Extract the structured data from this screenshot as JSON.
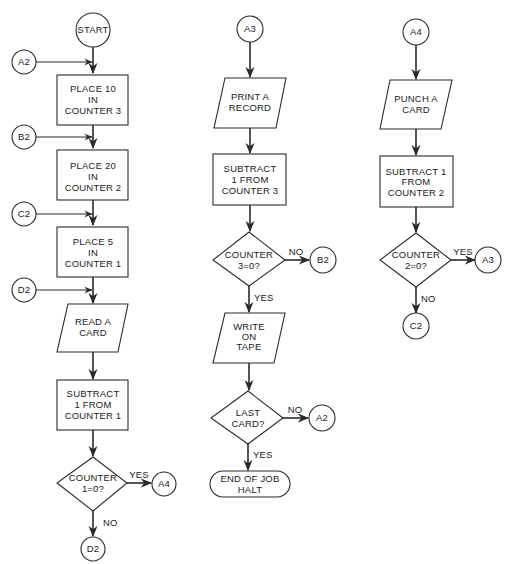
{
  "diagram": {
    "type": "flowchart",
    "colors": {
      "stroke": "#2a2a2a",
      "text": "#1a1a1a",
      "background": "#ffffff"
    },
    "columns": [
      {
        "id": "col1",
        "nodes": [
          {
            "id": "start",
            "shape": "circle",
            "lines": [
              "START"
            ]
          },
          {
            "id": "conn_a2_in",
            "shape": "connector",
            "lines": [
              "A2"
            ]
          },
          {
            "id": "place10",
            "shape": "process",
            "lines": [
              "PLACE 10",
              "IN",
              "COUNTER 3"
            ]
          },
          {
            "id": "conn_b2_in",
            "shape": "connector",
            "lines": [
              "B2"
            ]
          },
          {
            "id": "place20",
            "shape": "process",
            "lines": [
              "PLACE 20",
              "IN",
              "COUNTER 2"
            ]
          },
          {
            "id": "conn_c2_in",
            "shape": "connector",
            "lines": [
              "C2"
            ]
          },
          {
            "id": "place5",
            "shape": "process",
            "lines": [
              "PLACE 5",
              "IN",
              "COUNTER 1"
            ]
          },
          {
            "id": "conn_d2_in",
            "shape": "connector",
            "lines": [
              "D2"
            ]
          },
          {
            "id": "read_card",
            "shape": "io",
            "lines": [
              "READ A",
              "CARD"
            ]
          },
          {
            "id": "sub_c1",
            "shape": "process",
            "lines": [
              "SUBTRACT",
              "1 FROM",
              "COUNTER 1"
            ]
          },
          {
            "id": "dec_c1",
            "shape": "decision",
            "lines": [
              "COUNTER",
              "1=0?"
            ]
          },
          {
            "id": "conn_a4_out",
            "shape": "connector",
            "lines": [
              "A4"
            ]
          },
          {
            "id": "conn_d2_out",
            "shape": "connector",
            "lines": [
              "D2"
            ]
          }
        ],
        "edge_labels": {
          "yes": "YES",
          "no": "NO"
        }
      },
      {
        "id": "col2",
        "nodes": [
          {
            "id": "conn_a3_in",
            "shape": "connector",
            "lines": [
              "A3"
            ]
          },
          {
            "id": "print_record",
            "shape": "io",
            "lines": [
              "PRINT A",
              "RECORD"
            ]
          },
          {
            "id": "sub_c3",
            "shape": "process",
            "lines": [
              "SUBTRACT",
              "1 FROM",
              "COUNTER 3"
            ]
          },
          {
            "id": "dec_c3",
            "shape": "decision",
            "lines": [
              "COUNTER",
              "3=0?"
            ]
          },
          {
            "id": "conn_b2_out",
            "shape": "connector",
            "lines": [
              "B2"
            ]
          },
          {
            "id": "write_tape",
            "shape": "io",
            "lines": [
              "WRITE",
              "ON",
              "TAPE"
            ]
          },
          {
            "id": "dec_last",
            "shape": "decision",
            "lines": [
              "LAST",
              "CARD?"
            ]
          },
          {
            "id": "conn_a2_out",
            "shape": "connector",
            "lines": [
              "A2"
            ]
          },
          {
            "id": "end",
            "shape": "terminal",
            "lines": [
              "END OF JOB",
              "HALT"
            ]
          }
        ],
        "edge_labels": {
          "c3_no": "NO",
          "c3_yes": "YES",
          "last_no": "NO",
          "last_yes": "YES"
        }
      },
      {
        "id": "col3",
        "nodes": [
          {
            "id": "conn_a4_in",
            "shape": "connector",
            "lines": [
              "A4"
            ]
          },
          {
            "id": "punch_card",
            "shape": "io",
            "lines": [
              "PUNCH A",
              "CARD"
            ]
          },
          {
            "id": "sub_c2",
            "shape": "process",
            "lines": [
              "SUBTRACT 1",
              "FROM",
              "COUNTER 2"
            ]
          },
          {
            "id": "dec_c2",
            "shape": "decision",
            "lines": [
              "COUNTER",
              "2=0?"
            ]
          },
          {
            "id": "conn_a3_out",
            "shape": "connector",
            "lines": [
              "A3"
            ]
          },
          {
            "id": "conn_c2_out",
            "shape": "connector",
            "lines": [
              "C2"
            ]
          }
        ],
        "edge_labels": {
          "yes": "YES",
          "no": "NO"
        }
      }
    ]
  }
}
